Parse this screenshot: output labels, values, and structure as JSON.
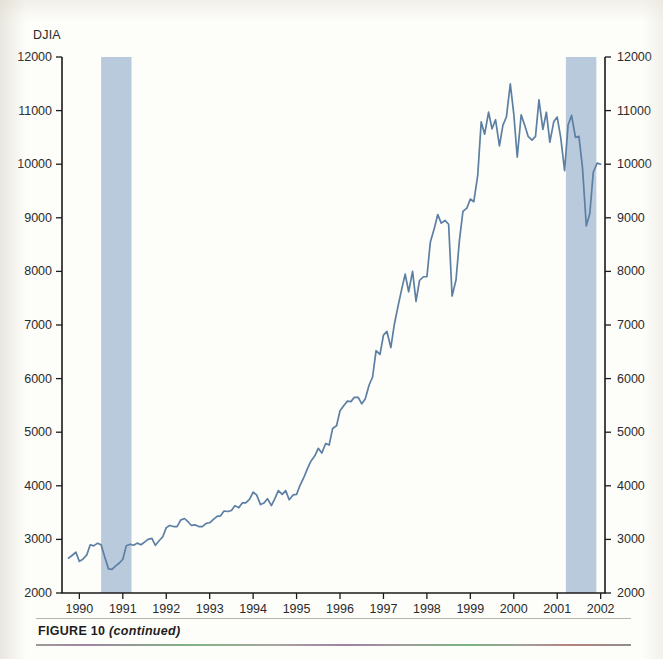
{
  "figure": {
    "caption_label": "FIGURE 10",
    "caption_note": "(continued)"
  },
  "colors": {
    "line": "#5c7fa3",
    "recession_band": "#b9cadd",
    "axis": "#1b1b1b",
    "text": "#2b2b2b",
    "background": "#fdfdfa"
  },
  "chart_data": {
    "type": "line",
    "title": "",
    "ylabel": "DJIA",
    "xlabel": "",
    "ylim": [
      2000,
      12000
    ],
    "xlim": [
      1989.6,
      2002.1
    ],
    "grid": false,
    "legend": null,
    "y_ticks": [
      2000,
      3000,
      4000,
      5000,
      6000,
      7000,
      8000,
      9000,
      10000,
      11000,
      12000
    ],
    "y_ticks_right": [
      2000,
      3000,
      4000,
      5000,
      6000,
      7000,
      8000,
      9000,
      10000,
      11000,
      12000
    ],
    "x_ticks": [
      1990,
      1991,
      1992,
      1993,
      1994,
      1995,
      1996,
      1997,
      1998,
      1999,
      2000,
      2001,
      2002
    ],
    "x_tick_labels": [
      "1990",
      "1991",
      "1992",
      "1993",
      "1994",
      "1995",
      "1996",
      "1997",
      "1998",
      "1999",
      "2000",
      "2001",
      "2002"
    ],
    "shaded_regions": [
      {
        "label": "recession-1990-1991",
        "x_start": 1990.5,
        "x_end": 1991.2
      },
      {
        "label": "recession-2001",
        "x_start": 2001.2,
        "x_end": 2001.9
      }
    ],
    "series": [
      {
        "name": "DJIA",
        "x": [
          1989.75,
          1989.83,
          1989.92,
          1990.0,
          1990.08,
          1990.17,
          1990.25,
          1990.33,
          1990.42,
          1990.5,
          1990.58,
          1990.67,
          1990.75,
          1990.83,
          1990.92,
          1991.0,
          1991.08,
          1991.17,
          1991.25,
          1991.33,
          1991.42,
          1991.5,
          1991.58,
          1991.67,
          1991.75,
          1991.83,
          1991.92,
          1992.0,
          1992.08,
          1992.17,
          1992.25,
          1992.33,
          1992.42,
          1992.5,
          1992.58,
          1992.67,
          1992.75,
          1992.83,
          1992.92,
          1993.0,
          1993.08,
          1993.17,
          1993.25,
          1993.33,
          1993.42,
          1993.5,
          1993.58,
          1993.67,
          1993.75,
          1993.83,
          1993.92,
          1994.0,
          1994.08,
          1994.17,
          1994.25,
          1994.33,
          1994.42,
          1994.5,
          1994.58,
          1994.67,
          1994.75,
          1994.83,
          1994.92,
          1995.0,
          1995.08,
          1995.17,
          1995.25,
          1995.33,
          1995.42,
          1995.5,
          1995.58,
          1995.67,
          1995.75,
          1995.83,
          1995.92,
          1996.0,
          1996.08,
          1996.17,
          1996.25,
          1996.33,
          1996.42,
          1996.5,
          1996.58,
          1996.67,
          1996.75,
          1996.83,
          1996.92,
          1997.0,
          1997.08,
          1997.17,
          1997.25,
          1997.33,
          1997.42,
          1997.5,
          1997.58,
          1997.67,
          1997.75,
          1997.83,
          1997.92,
          1998.0,
          1998.08,
          1998.17,
          1998.25,
          1998.33,
          1998.42,
          1998.5,
          1998.58,
          1998.67,
          1998.75,
          1998.83,
          1998.92,
          1999.0,
          1999.08,
          1999.17,
          1999.25,
          1999.33,
          1999.42,
          1999.5,
          1999.58,
          1999.67,
          1999.75,
          1999.83,
          1999.92,
          2000.0,
          2000.08,
          2000.17,
          2000.25,
          2000.33,
          2000.42,
          2000.5,
          2000.58,
          2000.67,
          2000.75,
          2000.83,
          2000.92,
          2001.0,
          2001.08,
          2001.17,
          2001.25,
          2001.33,
          2001.42,
          2001.5,
          2001.58,
          2001.67,
          2001.75,
          2001.83,
          2001.92,
          2002.0
        ],
        "values": [
          2650,
          2700,
          2760,
          2590,
          2630,
          2710,
          2900,
          2880,
          2930,
          2900,
          2680,
          2450,
          2440,
          2500,
          2560,
          2630,
          2880,
          2910,
          2890,
          2930,
          2900,
          2950,
          3000,
          3020,
          2890,
          2970,
          3050,
          3220,
          3260,
          3240,
          3240,
          3360,
          3390,
          3330,
          3260,
          3270,
          3240,
          3240,
          3300,
          3310,
          3370,
          3430,
          3440,
          3530,
          3520,
          3540,
          3630,
          3590,
          3680,
          3680,
          3750,
          3880,
          3830,
          3650,
          3680,
          3760,
          3630,
          3760,
          3910,
          3840,
          3910,
          3740,
          3830,
          3840,
          4010,
          4160,
          4320,
          4460,
          4560,
          4700,
          4610,
          4790,
          4760,
          5070,
          5120,
          5400,
          5490,
          5580,
          5570,
          5650,
          5650,
          5530,
          5620,
          5880,
          6030,
          6520,
          6450,
          6810,
          6880,
          6580,
          7010,
          7330,
          7670,
          7950,
          7620,
          8000,
          7440,
          7830,
          7900,
          7900,
          8550,
          8800,
          9060,
          8900,
          8950,
          8880,
          7540,
          7840,
          8590,
          9120,
          9180,
          9350,
          9300,
          9790,
          10790,
          10560,
          10970,
          10660,
          10830,
          10340,
          10730,
          10880,
          11500,
          10940,
          10130,
          10920,
          10730,
          10520,
          10450,
          10520,
          11200,
          10650,
          10970,
          10410,
          10790,
          10880,
          10500,
          9880,
          10730,
          10910,
          10500,
          10520,
          9950,
          8850,
          9080,
          9850,
          10020,
          10000
        ]
      }
    ]
  }
}
